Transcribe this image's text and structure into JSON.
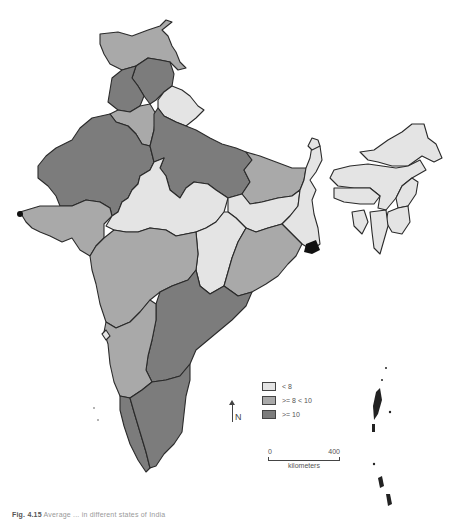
{
  "figure": {
    "caption_label": "Fig. 4.15",
    "caption_text": "Average ... in different states of India"
  },
  "map": {
    "region": "India",
    "classes": [
      {
        "id": "low",
        "label": "< 8",
        "color": "#e4e4e4"
      },
      {
        "id": "mid",
        "label": ">= 8 < 10",
        "color": "#a9a9a9"
      },
      {
        "id": "high",
        "label": ">= 10",
        "color": "#7c7c7c"
      }
    ],
    "regions": [
      {
        "name": "Jammu & Kashmir",
        "class": "mid"
      },
      {
        "name": "Himachal Pradesh",
        "class": "high"
      },
      {
        "name": "Punjab",
        "class": "high"
      },
      {
        "name": "Uttarakhand",
        "class": "low"
      },
      {
        "name": "Haryana",
        "class": "mid"
      },
      {
        "name": "Rajasthan",
        "class": "high"
      },
      {
        "name": "Uttar Pradesh",
        "class": "high"
      },
      {
        "name": "Bihar",
        "class": "mid"
      },
      {
        "name": "Gujarat",
        "class": "mid"
      },
      {
        "name": "Madhya Pradesh",
        "class": "low"
      },
      {
        "name": "Jharkhand",
        "class": "low"
      },
      {
        "name": "West Bengal",
        "class": "low"
      },
      {
        "name": "Chhattisgarh",
        "class": "low"
      },
      {
        "name": "Odisha",
        "class": "mid"
      },
      {
        "name": "Maharashtra",
        "class": "mid"
      },
      {
        "name": "Andhra Pradesh",
        "class": "high"
      },
      {
        "name": "Karnataka",
        "class": "mid"
      },
      {
        "name": "Goa",
        "class": "low"
      },
      {
        "name": "Kerala",
        "class": "high"
      },
      {
        "name": "Tamil Nadu",
        "class": "high"
      },
      {
        "name": "Sikkim",
        "class": "low"
      },
      {
        "name": "Arunachal Pradesh",
        "class": "low"
      },
      {
        "name": "Assam",
        "class": "low"
      },
      {
        "name": "Meghalaya",
        "class": "low"
      },
      {
        "name": "Nagaland",
        "class": "low"
      },
      {
        "name": "Manipur",
        "class": "low"
      },
      {
        "name": "Mizoram",
        "class": "low"
      },
      {
        "name": "Tripura",
        "class": "low"
      }
    ]
  },
  "legend": {
    "items": [
      {
        "label": "< 8"
      },
      {
        "label": ">= 8 < 10"
      },
      {
        "label": ">= 10"
      }
    ]
  },
  "north_arrow": {
    "label": "N"
  },
  "scale_bar": {
    "start": "0",
    "end": "400",
    "unit": "kilometers"
  }
}
